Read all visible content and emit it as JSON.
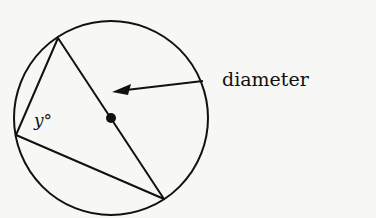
{
  "diagram": {
    "type": "inscribed-triangle-in-circle",
    "labels": {
      "angle": "y°",
      "pointer": "diameter"
    },
    "colors": {
      "stroke": "#111111",
      "background": "#f7f7f5"
    }
  }
}
